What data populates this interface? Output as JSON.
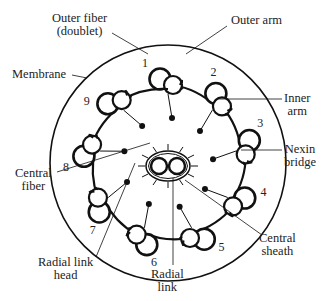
{
  "diagram": {
    "colors": {
      "stroke": "#111111",
      "text": "#222222",
      "background": "#ffffff"
    },
    "doublet_numbers": [
      "1",
      "2",
      "3",
      "4",
      "5",
      "6",
      "7",
      "8",
      "9"
    ],
    "labels": {
      "outer_fiber": "Outer fiber",
      "outer_fiber_sub": "(doublet)",
      "outer_arm": "Outer arm",
      "membrane": "Membrane",
      "inner_arm_1": "Inner",
      "inner_arm_2": "arm",
      "nexin_1": "Nexin",
      "nexin_2": "bridge",
      "central_fiber_1": "Central",
      "central_fiber_2": "fiber",
      "central_sheath_1": "Central",
      "central_sheath_2": "sheath",
      "radial_head_1": "Radial link",
      "radial_head_2": "head",
      "radial_link_1": "Radial",
      "radial_link_2": "link"
    }
  }
}
